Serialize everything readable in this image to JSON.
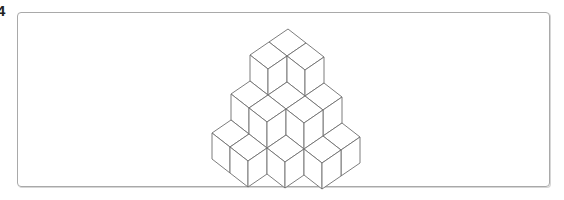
{
  "question": {
    "number_label": "4"
  },
  "figure": {
    "line_color": "#6e6e6e",
    "face_color": "#ffffff",
    "cubes": [
      {
        "i": 0,
        "j": 0,
        "k": 0
      },
      {
        "i": 1,
        "j": 0,
        "k": 0
      },
      {
        "i": 2,
        "j": 0,
        "k": 0
      },
      {
        "i": 3,
        "j": 0,
        "k": 0
      },
      {
        "i": 0,
        "j": 1,
        "k": 0
      },
      {
        "i": 1,
        "j": 1,
        "k": 0
      },
      {
        "i": 2,
        "j": 1,
        "k": 0
      },
      {
        "i": 3,
        "j": 1,
        "k": 0
      },
      {
        "i": 0,
        "j": 2,
        "k": 0
      },
      {
        "i": 1,
        "j": 2,
        "k": 0
      },
      {
        "i": 2,
        "j": 2,
        "k": 0
      },
      {
        "i": 0,
        "j": 3,
        "k": 0
      },
      {
        "i": 1,
        "j": 3,
        "k": 0
      },
      {
        "i": 0,
        "j": 0,
        "k": 1
      },
      {
        "i": 1,
        "j": 0,
        "k": 1
      },
      {
        "i": 2,
        "j": 0,
        "k": 1
      },
      {
        "i": 0,
        "j": 1,
        "k": 1
      },
      {
        "i": 1,
        "j": 1,
        "k": 1
      },
      {
        "i": 2,
        "j": 1,
        "k": 1
      },
      {
        "i": 0,
        "j": 2,
        "k": 1
      },
      {
        "i": 1,
        "j": 2,
        "k": 1
      },
      {
        "i": 0,
        "j": 0,
        "k": 2
      },
      {
        "i": 1,
        "j": 0,
        "k": 2
      },
      {
        "i": 0,
        "j": 1,
        "k": 2
      }
    ]
  }
}
